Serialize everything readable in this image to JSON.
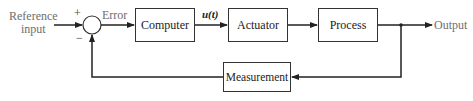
{
  "diagram": {
    "type": "feedback-control-block-diagram",
    "input_label": "Reference input",
    "input_label_lines": [
      "Reference",
      "input"
    ],
    "summing_junction": {
      "plus_sign": "+",
      "minus_sign": "−"
    },
    "error_label": "Error",
    "blocks": [
      {
        "id": "computer",
        "label": "Computer"
      },
      {
        "id": "actuator",
        "label": "Actuator"
      },
      {
        "id": "process",
        "label": "Process"
      },
      {
        "id": "measurement",
        "label": "Measurement"
      }
    ],
    "signal_labels": {
      "control_signal": "u(t)"
    },
    "output_label": "Output",
    "colors": {
      "line": "#222222",
      "label_gray": "#6e6e6e",
      "background": "#ffffff"
    }
  }
}
